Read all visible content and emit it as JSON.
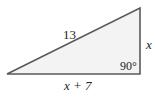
{
  "diagram": {
    "type": "right-triangle",
    "fill_color": "#f3f3f4",
    "stroke_color": "#58595b",
    "text_color": "#231f20",
    "vertices": {
      "left": [
        7,
        74
      ],
      "top_right": [
        140,
        8
      ],
      "bottom_right": [
        140,
        74
      ]
    },
    "labels": {
      "hypotenuse": "13",
      "vertical_leg": "x",
      "horizontal_leg": "x + 7",
      "right_angle": "90°"
    }
  }
}
